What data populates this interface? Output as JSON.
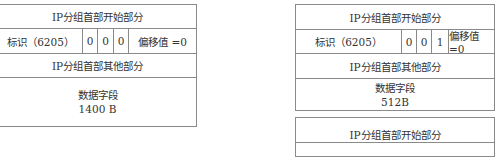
{
  "packets": [
    {
      "header_start": "IP分组首部开始部分",
      "identifier": "标识（6205）",
      "flags": [
        "0",
        "0",
        "0"
      ],
      "offset": "偏移值 =0",
      "header_other": "IP分组首部其他部分",
      "data_label": "数据字段",
      "data_size": "1400 B"
    },
    {
      "header_start": "IP分组首部开始部分",
      "identifier": "标识（6205）",
      "flags": [
        "0",
        "0",
        "1"
      ],
      "offset": "偏移值=0",
      "header_other": "IP分组首部其他部分",
      "data_label": "数据字段",
      "data_size": "512B"
    },
    {
      "header_start": "IP分组首部开始部分"
    }
  ]
}
